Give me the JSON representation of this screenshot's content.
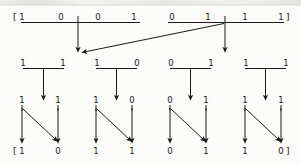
{
  "figure": {
    "ink_color": "#1a1a1c",
    "background_color": "#fbfbfa",
    "open_bracket": "[",
    "close_bracket": "]"
  },
  "level1": {
    "name": "top-row",
    "bits": [
      "1",
      "0",
      "0",
      "1",
      "0",
      "1",
      "1",
      "1"
    ],
    "bars": [
      {
        "bits": [
          "1",
          "0",
          "0",
          "1"
        ]
      },
      {
        "bits": [
          "0",
          "1",
          "1",
          "1"
        ]
      }
    ]
  },
  "level2": {
    "name": "middle-row",
    "groups": [
      {
        "bits": [
          "1",
          "1"
        ]
      },
      {
        "bits": [
          "1",
          "0"
        ]
      },
      {
        "bits": [
          "0",
          "1"
        ]
      },
      {
        "bits": [
          "1",
          "1"
        ]
      }
    ]
  },
  "level3": {
    "name": "bottom-row",
    "groups": [
      {
        "top_bits": [
          "1",
          "1"
        ],
        "bottom_bits": [
          "1",
          "0"
        ]
      },
      {
        "top_bits": [
          "1",
          "0"
        ],
        "bottom_bits": [
          "1",
          "1"
        ]
      },
      {
        "top_bits": [
          "0",
          "1"
        ],
        "bottom_bits": [
          "0",
          "1"
        ]
      },
      {
        "top_bits": [
          "1",
          "1"
        ],
        "bottom_bits": [
          "1",
          "0"
        ]
      }
    ],
    "result_bits": [
      "1",
      "0",
      "1",
      "1",
      "0",
      "1",
      "1",
      "0"
    ]
  }
}
